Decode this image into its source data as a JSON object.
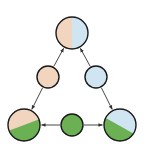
{
  "diagram": {
    "width": 144,
    "height": 153,
    "colors": {
      "peach": "#f2d5bf",
      "blue": "#cfe6f2",
      "green": "#6bb052",
      "stroke": "#1a1a1a",
      "edge": "#333333"
    },
    "nodes": [
      {
        "id": "top",
        "cx": 72,
        "cy": 33,
        "r": 16,
        "fill": "split-vertical",
        "colors": [
          "peach",
          "blue"
        ]
      },
      {
        "id": "mid-left",
        "cx": 48,
        "cy": 77,
        "r": 11,
        "fill": "solid",
        "colors": [
          "peach"
        ]
      },
      {
        "id": "mid-right",
        "cx": 96,
        "cy": 77,
        "r": 11,
        "fill": "solid",
        "colors": [
          "blue"
        ]
      },
      {
        "id": "bottom-left",
        "cx": 24,
        "cy": 125,
        "r": 16,
        "fill": "split-diagonal",
        "colors": [
          "peach",
          "green"
        ]
      },
      {
        "id": "bottom-center",
        "cx": 72,
        "cy": 125,
        "r": 11,
        "fill": "solid",
        "colors": [
          "green"
        ]
      },
      {
        "id": "bottom-right",
        "cx": 120,
        "cy": 125,
        "r": 16,
        "fill": "split-diagonal",
        "colors": [
          "blue",
          "green"
        ]
      }
    ],
    "edges": [
      {
        "from": "mid-left",
        "to": "top"
      },
      {
        "from": "mid-right",
        "to": "top"
      },
      {
        "from": "mid-left",
        "to": "bottom-left"
      },
      {
        "from": "mid-right",
        "to": "bottom-right"
      },
      {
        "from": "bottom-center",
        "to": "bottom-left"
      },
      {
        "from": "bottom-center",
        "to": "bottom-right"
      }
    ]
  }
}
